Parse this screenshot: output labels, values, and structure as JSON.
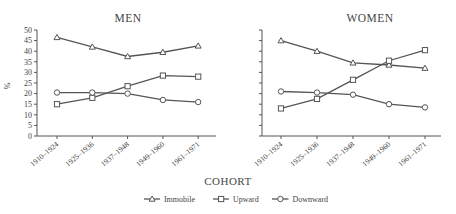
{
  "chart_data": [
    {
      "type": "line",
      "title": "MEN",
      "xlabel": "COHORT",
      "ylabel": "%",
      "ylim": [
        0,
        50
      ],
      "yticks": [
        0,
        5,
        10,
        15,
        20,
        25,
        30,
        35,
        40,
        45,
        50
      ],
      "categories": [
        "1910–1924",
        "1925–1936",
        "1937–1948",
        "1949–1960",
        "1961–1971"
      ],
      "series": [
        {
          "name": "Immobile",
          "marker": "triangle",
          "values": [
            46.5,
            42,
            37.5,
            39.5,
            42.5
          ]
        },
        {
          "name": "Upward",
          "marker": "square",
          "values": [
            15,
            18,
            23.5,
            28.5,
            28
          ]
        },
        {
          "name": "Downward",
          "marker": "circle",
          "values": [
            20.5,
            20.5,
            20,
            17,
            16
          ]
        }
      ],
      "grid": false
    },
    {
      "type": "line",
      "title": "WOMEN",
      "xlabel": "COHORT",
      "ylabel": "",
      "ylim": [
        0,
        50
      ],
      "yticks": [
        0,
        5,
        10,
        15,
        20,
        25,
        30,
        35,
        40,
        45,
        50
      ],
      "categories": [
        "1910–1924",
        "1925–1936",
        "1937–1948",
        "1949–1960",
        "1961–1971"
      ],
      "series": [
        {
          "name": "Immobile",
          "marker": "triangle",
          "values": [
            45,
            40,
            34.5,
            33.5,
            32
          ]
        },
        {
          "name": "Upward",
          "marker": "square",
          "values": [
            13,
            17.5,
            26.5,
            35.5,
            40.5
          ]
        },
        {
          "name": "Downward",
          "marker": "circle",
          "values": [
            21,
            20.5,
            19.5,
            15,
            13.5
          ]
        }
      ],
      "grid": false
    }
  ],
  "labels": {
    "men_title": "MEN",
    "women_title": "WOMEN",
    "y_axis_label": "%",
    "x_axis_label": "COHORT"
  },
  "legend": [
    {
      "label": "Immobile",
      "marker": "triangle"
    },
    {
      "label": "Upward",
      "marker": "square"
    },
    {
      "label": "Downward",
      "marker": "circle"
    }
  ],
  "colors": {
    "line": "#555555",
    "text": "#444444",
    "background": "#ffffff"
  }
}
